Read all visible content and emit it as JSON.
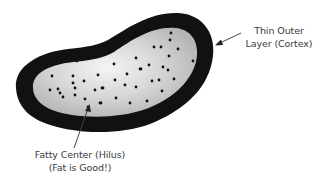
{
  "diagram": {
    "colors": {
      "outer_layer": "#111111",
      "inner_center_light": "#f2f2f2",
      "inner_center_dark": "#b9b9b9",
      "dots": "#111111",
      "arrows": "#444444",
      "text": "#3a3a3a",
      "background": "#ffffff"
    },
    "labels": {
      "cortex": {
        "line1": "Thin Outer",
        "line2": "Layer (Cortex)"
      },
      "hilus": {
        "line1": "Fatty Center (Hilus)",
        "line2": "(Fat is Good!)"
      }
    },
    "arrows": [
      {
        "name": "cortex-arrow",
        "from": [
          241,
          33
        ],
        "to": [
          216,
          45
        ]
      },
      {
        "name": "hilus-arrow",
        "from": [
          74,
          148
        ],
        "to": [
          89,
          106
        ]
      }
    ],
    "dots": [
      [
        77,
        61
      ],
      [
        52,
        76
      ],
      [
        73,
        76
      ],
      [
        98,
        75
      ],
      [
        73,
        83
      ],
      [
        84,
        81
      ],
      [
        75,
        88
      ],
      [
        50,
        90
      ],
      [
        58,
        89
      ],
      [
        60,
        93
      ],
      [
        95,
        90
      ],
      [
        103,
        88
      ],
      [
        63,
        97
      ],
      [
        75,
        95
      ],
      [
        85,
        99
      ],
      [
        100,
        103
      ],
      [
        88,
        107
      ],
      [
        114,
        64
      ],
      [
        115,
        80
      ],
      [
        102,
        88
      ],
      [
        116,
        98
      ],
      [
        101,
        103
      ],
      [
        125,
        85
      ],
      [
        127,
        74
      ],
      [
        136,
        87
      ],
      [
        130,
        103
      ],
      [
        171,
        33
      ],
      [
        170,
        40
      ],
      [
        154,
        47
      ],
      [
        161,
        47
      ],
      [
        178,
        49
      ],
      [
        169,
        56
      ],
      [
        193,
        61
      ],
      [
        149,
        65
      ],
      [
        163,
        67
      ],
      [
        168,
        70
      ],
      [
        140,
        69
      ],
      [
        141,
        69
      ],
      [
        174,
        79
      ],
      [
        159,
        80
      ],
      [
        152,
        81
      ],
      [
        162,
        91
      ],
      [
        147,
        101
      ],
      [
        136,
        58
      ]
    ]
  }
}
